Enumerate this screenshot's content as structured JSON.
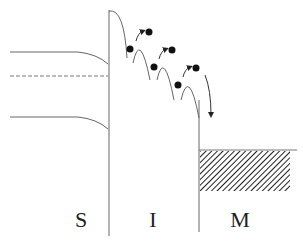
{
  "diagram": {
    "type": "energy-band-diagram",
    "regions": [
      {
        "id": "semiconductor",
        "label": "S",
        "x": 81
      },
      {
        "id": "insulator",
        "label": "I",
        "x": 153
      },
      {
        "id": "metal",
        "label": "M",
        "x": 240
      }
    ],
    "colors": {
      "line": "#555555",
      "electron": "#111111",
      "hatch": "#222222"
    },
    "hops": 4
  }
}
